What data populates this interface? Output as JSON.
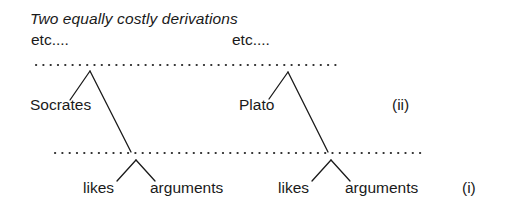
{
  "figure": {
    "caption": "Two equally costly derivations",
    "background_color": "#ffffff",
    "ink_color": "#1a1a1a"
  },
  "labels": {
    "etc_left": "etc....",
    "etc_right": "etc....",
    "node_socrates": "Socrates",
    "node_plato": "Plato",
    "leaf_likes_left": "likes",
    "leaf_arguments_left": "arguments",
    "leaf_likes_right": "likes",
    "leaf_arguments_right": "arguments",
    "marker_upper": "(ii)",
    "marker_lower": "(i)"
  },
  "chart_data": {
    "type": "diagram",
    "title": "Two equally costly derivations",
    "tiers": [
      {
        "name": "upper-tier",
        "marker": "(ii)",
        "dotted_line": {
          "x1": 36,
          "x2": 337,
          "y": 65
        }
      },
      {
        "name": "lower-tier",
        "marker": "(i)",
        "dotted_line": {
          "x1": 55,
          "x2": 427,
          "y": 153
        }
      }
    ],
    "triangles": [
      {
        "label": "Socrates",
        "apex": [
          90,
          71
        ],
        "left_foot": [
          70,
          100
        ],
        "right_foot": [
          131,
          152
        ],
        "tier": "upper-tier"
      },
      {
        "label": "Plato",
        "apex": [
          288,
          72
        ],
        "left_foot": [
          269,
          99
        ],
        "right_foot": [
          328,
          152
        ],
        "tier": "upper-tier"
      },
      {
        "label": "likes arguments (left)",
        "apex": [
          136,
          160
        ],
        "left_foot": [
          117,
          181
        ],
        "right_foot": [
          155,
          181
        ],
        "tier": "lower-tier"
      },
      {
        "label": "likes arguments (right)",
        "apex": [
          331,
          160
        ],
        "left_foot": [
          312,
          181
        ],
        "right_foot": [
          350,
          181
        ],
        "tier": "lower-tier"
      }
    ],
    "text_positions": [
      {
        "text": "Two equally costly derivations",
        "x": 30,
        "y": 12,
        "style": "italic"
      },
      {
        "text": "etc....",
        "x": 31,
        "y": 33,
        "style": "regular"
      },
      {
        "text": "etc....",
        "x": 232,
        "y": 33,
        "style": "regular"
      },
      {
        "text": "Socrates",
        "x": 30,
        "y": 98,
        "style": "regular"
      },
      {
        "text": "Plato",
        "x": 239,
        "y": 98,
        "style": "regular"
      },
      {
        "text": "(ii)",
        "x": 392,
        "y": 98,
        "style": "regular"
      },
      {
        "text": "likes",
        "x": 83,
        "y": 181,
        "style": "regular"
      },
      {
        "text": "arguments",
        "x": 150,
        "y": 181,
        "style": "regular"
      },
      {
        "text": "likes",
        "x": 278,
        "y": 181,
        "style": "regular"
      },
      {
        "text": "arguments",
        "x": 345,
        "y": 181,
        "style": "regular"
      },
      {
        "text": "(i)",
        "x": 462,
        "y": 181,
        "style": "regular"
      }
    ]
  }
}
